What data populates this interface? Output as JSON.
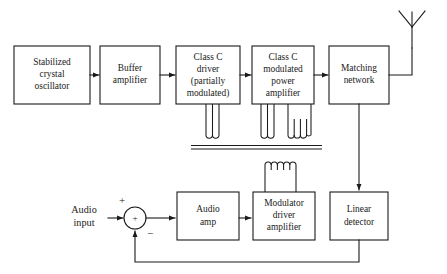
{
  "figure": {
    "type": "block-diagram",
    "background_color": "#ffffff",
    "line_color": "#1a1a1a"
  },
  "blocks": [
    {
      "id": "stabilized-crystal-oscillator",
      "lines": [
        "Stabilized",
        "crystal",
        "oscillator"
      ],
      "x": 14,
      "y": 46,
      "w": 76,
      "h": 58
    },
    {
      "id": "buffer-amplifier",
      "lines": [
        "Buffer",
        "amplifier"
      ],
      "x": 100,
      "y": 46,
      "w": 60,
      "h": 58
    },
    {
      "id": "class-c-driver",
      "lines": [
        "Class C",
        "driver",
        "(partially",
        "modulated)"
      ],
      "x": 176,
      "y": 46,
      "w": 64,
      "h": 58
    },
    {
      "id": "class-c-modulated-power-amplifier",
      "lines": [
        "Class C",
        "modulated",
        "power",
        "amplifier"
      ],
      "x": 252,
      "y": 46,
      "w": 62,
      "h": 58
    },
    {
      "id": "matching-network",
      "lines": [
        "Matching",
        "network"
      ],
      "x": 329,
      "y": 46,
      "w": 60,
      "h": 58
    },
    {
      "id": "audio-amp",
      "lines": [
        "Audio",
        "amp"
      ],
      "x": 177,
      "y": 192,
      "w": 62,
      "h": 48
    },
    {
      "id": "modulator-driver-amplifier",
      "lines": [
        "Modulator",
        "driver",
        "amplifier"
      ],
      "x": 253,
      "y": 192,
      "w": 62,
      "h": 48
    },
    {
      "id": "linear-detector",
      "lines": [
        "Linear",
        "detector"
      ],
      "x": 330,
      "y": 192,
      "w": 58,
      "h": 48
    }
  ],
  "io": {
    "audio_input": {
      "lines": [
        "Audio",
        "input"
      ],
      "x": 84,
      "y": 211
    },
    "antenna": {
      "name": "antenna",
      "x": 412,
      "y": 18
    }
  },
  "summing_junction": {
    "id": "summing-junction",
    "cx": 135,
    "cy": 218,
    "r": 11,
    "operator": "+",
    "plus_label": {
      "text": "+",
      "x": 122,
      "y": 201
    },
    "minus_label": {
      "text": "−",
      "x": 150,
      "y": 234
    }
  },
  "transformer": {
    "id": "modulation-transformer",
    "core_y_top": 146,
    "core_y_bottom": 149,
    "core_x1": 191,
    "core_x2": 322,
    "secondary_coils": [
      {
        "x1": 206,
        "x2": 219,
        "top": 104
      },
      {
        "x1": 261,
        "x2": 274,
        "top": 104
      },
      {
        "x1": 288,
        "x2": 311,
        "top": 104
      }
    ],
    "primary_coil": {
      "x1": 265,
      "x2": 296,
      "top": 160,
      "bottom": 192
    }
  },
  "connections": [
    {
      "from": "stabilized-crystal-oscillator",
      "to": "buffer-amplifier",
      "arrow": true
    },
    {
      "from": "buffer-amplifier",
      "to": "class-c-driver",
      "arrow": true
    },
    {
      "from": "class-c-driver",
      "to": "class-c-modulated-power-amplifier",
      "arrow": true
    },
    {
      "from": "class-c-modulated-power-amplifier",
      "to": "matching-network",
      "arrow": true
    },
    {
      "from": "matching-network",
      "to": "antenna",
      "arrow": false
    },
    {
      "from": "matching-network",
      "to": "linear-detector",
      "arrow": true
    },
    {
      "from": "audio-input",
      "to": "summing-junction",
      "arrow": true
    },
    {
      "from": "summing-junction",
      "to": "audio-amp",
      "arrow": true
    },
    {
      "from": "audio-amp",
      "to": "modulator-driver-amplifier",
      "arrow": true
    },
    {
      "from": "modulator-driver-amplifier",
      "to": "modulation-transformer",
      "arrow": false
    },
    {
      "from": "linear-detector",
      "to": "summing-junction",
      "arrow": true,
      "path": "feedback"
    }
  ]
}
